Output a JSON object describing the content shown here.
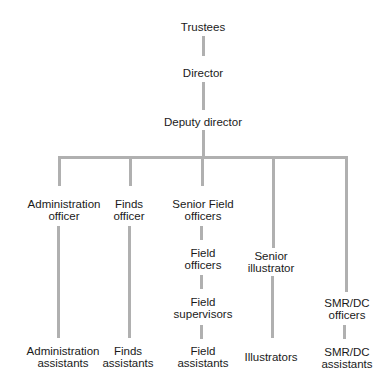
{
  "diagram": {
    "type": "org-chart",
    "line_color": "#b0b0b0",
    "nodes": {
      "trustees": {
        "lines": [
          "Trustees"
        ]
      },
      "director": {
        "lines": [
          "Director"
        ]
      },
      "deputy": {
        "lines": [
          "Deputy director"
        ]
      },
      "admin_officer": {
        "lines": [
          "Administration",
          "officer"
        ]
      },
      "finds_officer": {
        "lines": [
          "Finds",
          "officer"
        ]
      },
      "senior_field": {
        "lines": [
          "Senior Field",
          "officers"
        ]
      },
      "field_officers": {
        "lines": [
          "Field",
          "officers"
        ]
      },
      "field_supervisors": {
        "lines": [
          "Field",
          "supervisors"
        ]
      },
      "field_assistants": {
        "lines": [
          "Field",
          "assistants"
        ]
      },
      "senior_illustrator": {
        "lines": [
          "Senior",
          "illustrator"
        ]
      },
      "illustrators": {
        "lines": [
          "Illustrators"
        ]
      },
      "smr_officers": {
        "lines": [
          "SMR/DC",
          "officers"
        ]
      },
      "smr_assistants": {
        "lines": [
          "SMR/DC",
          "assistants"
        ]
      },
      "admin_assistants": {
        "lines": [
          "Administration",
          "assistants"
        ]
      },
      "finds_assistants": {
        "lines": [
          "Finds",
          "assistants"
        ]
      }
    },
    "edges": [
      [
        "Trustees",
        "Director"
      ],
      [
        "Director",
        "Deputy director"
      ],
      [
        "Deputy director",
        "Administration officer"
      ],
      [
        "Deputy director",
        "Finds officer"
      ],
      [
        "Deputy director",
        "Senior Field officers"
      ],
      [
        "Deputy director",
        "Senior illustrator"
      ],
      [
        "Deputy director",
        "SMR/DC officers"
      ],
      [
        "Administration officer",
        "Administration assistants"
      ],
      [
        "Finds officer",
        "Finds assistants"
      ],
      [
        "Senior Field officers",
        "Field officers"
      ],
      [
        "Field officers",
        "Field supervisors"
      ],
      [
        "Field supervisors",
        "Field assistants"
      ],
      [
        "Senior illustrator",
        "Illustrators"
      ],
      [
        "SMR/DC officers",
        "SMR/DC assistants"
      ]
    ]
  }
}
